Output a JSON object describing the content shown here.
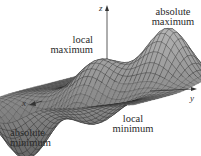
{
  "figure": {
    "axes": {
      "x": "x",
      "y": "y",
      "z": "z"
    },
    "annotations": {
      "absolute_maximum": [
        "absolute",
        "maximum"
      ],
      "local_maximum": [
        "local",
        "maximum"
      ],
      "local_minimum": [
        "local",
        "minimum"
      ],
      "absolute_minimum": [
        "absolute",
        "minimum"
      ]
    },
    "colors": {
      "surface_fill": "#8a8a8a",
      "mesh_line": "#1e1e1e",
      "axis": "#333333",
      "text": "#2a2a2a"
    }
  }
}
